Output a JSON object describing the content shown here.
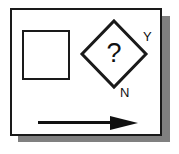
{
  "diagram": {
    "style": "3d-drop-shadow-panel",
    "panel": {
      "name": "flowchart-panel",
      "fill": "#ffffff",
      "border_color": "#1a1a1a",
      "shadow_color": "#808080"
    },
    "shapes": {
      "process_square": {
        "label": "",
        "kind": "process",
        "fill": "#ffffff",
        "stroke": "#1a1a1a"
      },
      "decision_diamond": {
        "label": "?",
        "kind": "decision",
        "fill": "#ffffff",
        "stroke": "#1a1a1a"
      },
      "flow_arrow": {
        "kind": "arrow",
        "direction": "right",
        "color": "#111111"
      }
    },
    "branch_labels": {
      "yes": "Y",
      "no": "N"
    }
  }
}
